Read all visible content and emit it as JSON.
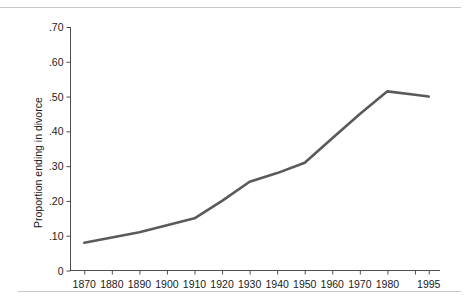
{
  "figure": {
    "background_color": "#ffffff",
    "rule_color": "#c8c8c8",
    "axis_color": "#4d4d4d",
    "line_color": "#5a5a5a",
    "text_color": "#1a1a1a"
  },
  "axes": {
    "y_title": "Proportion ending in divorce",
    "x_title": "",
    "y_tick_labels": [
      ".70",
      ".60",
      ".50",
      ".40",
      ".30",
      ".20",
      ".10",
      "0"
    ],
    "y_tick_values": [
      0.7,
      0.6,
      0.5,
      0.4,
      0.3,
      0.2,
      0.1,
      0
    ],
    "x_tick_labels": [
      "1870",
      "1880",
      "1890",
      "1900",
      "1910",
      "1920",
      "1930",
      "1940",
      "1950",
      "1960",
      "1970",
      "1980",
      "",
      "1995"
    ],
    "x_tick_values": [
      1870,
      1880,
      1890,
      1900,
      1910,
      1920,
      1930,
      1940,
      1950,
      1960,
      1970,
      1980,
      1990,
      1995
    ]
  },
  "chart_data": {
    "type": "line",
    "title": "",
    "subtitle": "",
    "xlabel": "",
    "ylabel": "Proportion ending in divorce",
    "xlim": [
      1865,
      1998
    ],
    "ylim": [
      0,
      0.7
    ],
    "grid": false,
    "legend": null,
    "x": [
      1870,
      1880,
      1890,
      1900,
      1910,
      1920,
      1930,
      1940,
      1950,
      1960,
      1970,
      1980,
      1990,
      1995
    ],
    "series": [
      {
        "name": "Proportion ending in divorce",
        "color": "#5a5a5a",
        "values": [
          0.08,
          0.095,
          0.11,
          0.13,
          0.15,
          0.2,
          0.255,
          0.28,
          0.31,
          0.38,
          0.45,
          0.515,
          0.505,
          0.5
        ]
      }
    ],
    "annotations": []
  }
}
